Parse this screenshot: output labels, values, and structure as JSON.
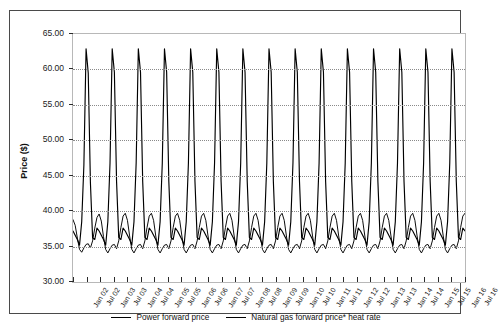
{
  "chart_data": {
    "type": "line",
    "title": "",
    "xlabel": "",
    "ylabel": "Price ($)",
    "ylim": [
      30.0,
      65.0
    ],
    "ytick_labels": [
      "65.00",
      "60.00",
      "55.00",
      "50.00",
      "45.00",
      "40.00",
      "35.00",
      "30.00"
    ],
    "ytick_values": [
      65.0,
      60.0,
      55.0,
      50.0,
      45.0,
      40.0,
      35.0,
      30.0
    ],
    "grid": "horizontal-dotted",
    "legend_position": "bottom-center",
    "categories": [
      "Jan 02",
      "Jul 02",
      "Jan 03",
      "Jul 03",
      "Jan 04",
      "Jul 04",
      "Jan 05",
      "Jul 05",
      "Jan 06",
      "Jul 06",
      "Jan 07",
      "Jul 07",
      "Jan 08",
      "Jul 08",
      "Jan 09",
      "Jul 09",
      "Jan 10",
      "Jul 10",
      "Jan 11",
      "Jul 11",
      "Jan 12",
      "Jul 12",
      "Jan 13",
      "Jul 13",
      "Jan 14",
      "Jul 14",
      "Jan 15",
      "Jul 15",
      "Jan 16",
      "Jul 16"
    ],
    "x_start": "Jan 02",
    "x_end": "Jul 16",
    "x_tick_interval_months": 6,
    "series": [
      {
        "name": "Power forward price",
        "color": "#000000",
        "pattern": "sharp summer spike to ~63 each July, trough ~34-35 in shoulder months",
        "monthly_values": [
          37.2,
          36.6,
          36.0,
          35.2,
          38.5,
          46.5,
          62.9,
          59.5,
          44.0,
          36.2,
          36.0,
          37.6,
          37.2,
          36.6,
          36.0,
          35.2,
          38.5,
          46.8,
          62.9,
          59.6,
          44.2,
          36.3,
          36.0,
          37.6,
          37.2,
          36.6,
          36.0,
          35.2,
          38.5,
          46.8,
          62.9,
          59.6,
          44.2,
          36.3,
          36.0,
          37.6,
          37.2,
          36.6,
          36.0,
          35.2,
          38.5,
          46.8,
          62.9,
          59.6,
          44.2,
          36.3,
          36.0,
          37.6,
          37.2,
          36.6,
          36.0,
          35.2,
          38.5,
          46.8,
          62.9,
          59.6,
          44.2,
          36.3,
          36.0,
          37.6,
          37.2,
          36.6,
          36.0,
          35.2,
          38.5,
          46.8,
          62.9,
          59.6,
          44.2,
          36.3,
          36.0,
          37.6,
          37.2,
          36.6,
          36.0,
          35.2,
          38.5,
          46.8,
          62.9,
          59.6,
          44.2,
          36.3,
          36.0,
          37.6,
          37.2,
          36.6,
          36.0,
          35.2,
          38.5,
          46.8,
          62.9,
          59.6,
          44.2,
          36.3,
          36.0,
          37.6,
          37.2,
          36.6,
          36.0,
          35.2,
          38.5,
          46.8,
          62.9,
          59.6,
          44.2,
          36.3,
          36.0,
          37.6,
          37.2,
          36.6,
          36.0,
          35.2,
          38.5,
          46.8,
          62.9,
          59.6,
          44.2,
          36.3,
          36.0,
          37.6,
          37.2,
          36.6,
          36.0,
          35.2,
          38.5,
          46.8,
          62.9,
          59.6,
          44.2,
          36.3,
          36.0,
          37.6,
          37.2,
          36.6,
          36.0,
          35.2,
          38.5,
          46.8,
          62.9,
          59.6,
          44.2,
          36.3,
          36.0,
          37.6,
          37.2,
          36.6,
          36.0,
          35.2,
          38.5,
          46.8,
          62.9,
          59.6,
          44.2,
          36.3,
          36.0,
          37.6,
          37.2,
          36.6,
          36.0,
          35.2,
          38.5,
          46.8,
          62.9,
          59.6,
          44.2,
          36.3,
          36.0,
          37.6,
          37.2,
          36.6,
          36.0,
          35.2,
          38.5,
          46.8,
          62.9,
          59.6,
          44.2,
          36.3,
          36.0,
          37.6,
          37.2
        ]
      },
      {
        "name": "Natural gas forward price* heat rate",
        "color": "#000000",
        "pattern": "winter peak ~39-40, summer trough ~33, secondary dips",
        "monthly_values": [
          38.8,
          38.0,
          36.2,
          34.6,
          34.2,
          34.8,
          35.3,
          35.4,
          34.8,
          35.8,
          37.6,
          39.1,
          39.6,
          38.6,
          36.4,
          34.6,
          34.1,
          34.7,
          35.2,
          35.3,
          34.7,
          35.8,
          37.7,
          39.3,
          39.7,
          38.7,
          36.5,
          34.6,
          34.1,
          34.7,
          35.2,
          35.3,
          34.7,
          35.8,
          37.7,
          39.3,
          39.7,
          38.7,
          36.5,
          34.6,
          34.1,
          34.7,
          35.2,
          35.3,
          34.7,
          35.8,
          37.7,
          39.3,
          39.7,
          38.7,
          36.5,
          34.6,
          34.1,
          34.7,
          35.2,
          35.3,
          34.7,
          35.8,
          37.7,
          39.3,
          39.7,
          38.7,
          36.5,
          34.6,
          34.1,
          34.7,
          35.2,
          35.3,
          34.7,
          35.8,
          37.7,
          39.3,
          39.7,
          38.7,
          36.5,
          34.6,
          34.1,
          34.7,
          35.2,
          35.3,
          34.7,
          35.8,
          37.7,
          39.3,
          39.7,
          38.7,
          36.5,
          34.6,
          34.1,
          34.7,
          35.2,
          35.3,
          34.7,
          35.8,
          37.7,
          39.3,
          39.7,
          38.7,
          36.5,
          34.6,
          34.1,
          34.7,
          35.2,
          35.3,
          34.7,
          35.8,
          37.7,
          39.3,
          39.7,
          38.7,
          36.5,
          34.6,
          34.1,
          34.7,
          35.2,
          35.3,
          34.7,
          35.8,
          37.7,
          39.3,
          39.7,
          38.7,
          36.5,
          34.6,
          34.1,
          34.7,
          35.2,
          35.3,
          34.7,
          35.8,
          37.7,
          39.3,
          39.7,
          38.7,
          36.5,
          34.6,
          34.1,
          34.7,
          35.2,
          35.3,
          34.7,
          35.8,
          37.7,
          39.3,
          39.7,
          38.7,
          36.5,
          34.6,
          34.1,
          34.7,
          35.2,
          35.3,
          34.7,
          35.8,
          37.7,
          39.3,
          39.7,
          38.7,
          36.5,
          34.6,
          34.1,
          34.7,
          35.2,
          35.3,
          34.7,
          35.8,
          37.7,
          39.3,
          39.7,
          38.7,
          36.5,
          34.6,
          34.1,
          34.7,
          35.2,
          35.3,
          34.7,
          35.8,
          37.7,
          39.3,
          39.7
        ]
      }
    ]
  },
  "legend": {
    "items": [
      {
        "label": "Power forward price"
      },
      {
        "label": "Natural gas forward price* heat rate"
      }
    ]
  }
}
